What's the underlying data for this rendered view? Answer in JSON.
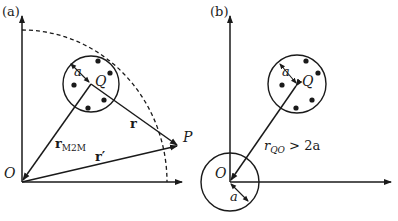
{
  "panel_a": {
    "label": "(a)",
    "origin_label": "O",
    "center_label": "Q",
    "radius_label": "a",
    "point_label": "P",
    "vector_r_label": "r",
    "vector_rm2m_label": "r",
    "vector_rm2m_subscript": "M2M",
    "vector_rprime_label": "r′"
  },
  "panel_b": {
    "label": "(b)",
    "origin_label": "O",
    "center_label": "Q",
    "radius_label_q": "a",
    "radius_label_o": "a",
    "distance_label": "r",
    "distance_subscript": "QO",
    "distance_condition": " > 2a"
  },
  "colors": {
    "stroke": "#1a1a1a",
    "background": "#ffffff"
  }
}
